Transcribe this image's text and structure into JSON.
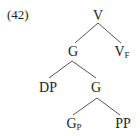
{
  "example_number": "(42)",
  "tree": {
    "root": {
      "label": "V",
      "sub": ""
    },
    "g_top": {
      "label": "G",
      "sub": ""
    },
    "v_f": {
      "label": "V",
      "sub": "F"
    },
    "dp": {
      "label": "DP",
      "sub": ""
    },
    "g_mid": {
      "label": "G",
      "sub": ""
    },
    "g_p": {
      "label": "G",
      "sub": "P"
    },
    "pp": {
      "label": "PP",
      "sub": ""
    }
  },
  "colors": {
    "text": "#222222",
    "edge": "#555555",
    "background": "#ffffff"
  }
}
